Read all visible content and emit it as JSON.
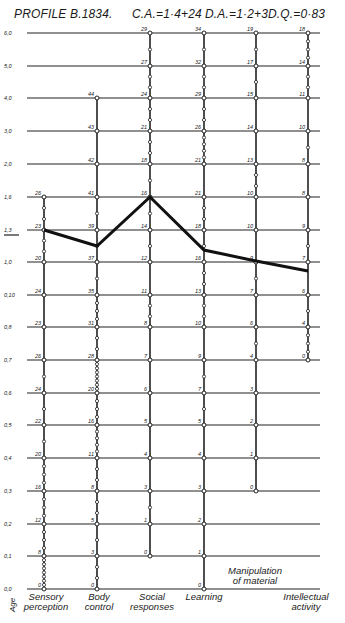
{
  "header": {
    "profile": "PROFILE B.1834.",
    "ca": "C.A.=1·4+24",
    "da": "D.A.=1·2+3",
    "dq": "D.Q.=0·83"
  },
  "chart_data": {
    "type": "line",
    "xlabel": "",
    "ylabel": "Age",
    "y_ticks": [
      "6,0",
      "5,0",
      "4,0",
      "3,0",
      "2,0",
      "1,6",
      "1,3",
      "1,0",
      "0,10",
      "0,8",
      "0,7",
      "0,6",
      "0,5",
      "0,4",
      "0,3",
      "0,2",
      "0,1",
      "0,0"
    ],
    "y_tick_px": [
      33,
      66,
      98,
      131,
      164,
      197,
      230,
      262,
      295,
      327,
      360,
      393,
      425,
      458,
      491,
      524,
      556,
      589
    ],
    "highlighted_tick": "1,3",
    "categories": [
      "Sensory perception",
      "Body control",
      "Social responses",
      "Learning",
      "Manipulation of material",
      "Intellectual activity"
    ],
    "column_x": [
      44,
      97,
      150,
      204,
      256,
      308
    ],
    "columns": [
      {
        "name": "Sensory perception",
        "label_lines": [
          "Sensory",
          "perception"
        ],
        "top_tick": "1,6",
        "scale": [
          {
            "y": "1,6",
            "v": "26"
          },
          {
            "y": "1,3",
            "v": "23"
          },
          {
            "y": "1,0",
            "v": "20"
          },
          {
            "y": "0,10",
            "v": "24"
          },
          {
            "y": "0,8",
            "v": "23"
          },
          {
            "y": "0,7",
            "v": "26"
          },
          {
            "y": "0,6",
            "v": "24"
          },
          {
            "y": "0,5",
            "v": "22"
          },
          {
            "y": "0,4",
            "v": "20"
          },
          {
            "y": "0,3",
            "v": "16"
          },
          {
            "y": "0,2",
            "v": "12"
          },
          {
            "y": "0,1",
            "v": "8"
          },
          {
            "y": "0,0",
            "v": "0"
          }
        ]
      },
      {
        "name": "Body control",
        "label_lines": [
          "Body",
          "control"
        ],
        "top_tick": "4,0",
        "scale": [
          {
            "y": "4,0",
            "v": "44"
          },
          {
            "y": "3,0",
            "v": "43"
          },
          {
            "y": "2,0",
            "v": "42"
          },
          {
            "y": "1,6",
            "v": "41"
          },
          {
            "y": "1,3",
            "v": "39"
          },
          {
            "y": "1,0",
            "v": "37"
          },
          {
            "y": "0,10",
            "v": "35"
          },
          {
            "y": "0,8",
            "v": "31"
          },
          {
            "y": "0,7",
            "v": "28"
          },
          {
            "y": "0,6",
            "v": "20"
          },
          {
            "y": "0,5",
            "v": "16"
          },
          {
            "y": "0,4",
            "v": "11"
          },
          {
            "y": "0,3",
            "v": "8"
          },
          {
            "y": "0,2",
            "v": "5"
          },
          {
            "y": "0,1",
            "v": "3"
          },
          {
            "y": "0,0",
            "v": "0"
          }
        ]
      },
      {
        "name": "Social responses",
        "label_lines": [
          "Social",
          "responses"
        ],
        "top_tick": "6,0",
        "scale": [
          {
            "y": "6,0",
            "v": "29"
          },
          {
            "y": "5,0",
            "v": "27"
          },
          {
            "y": "4,0",
            "v": "24"
          },
          {
            "y": "3,0",
            "v": "21"
          },
          {
            "y": "2,0",
            "v": "18"
          },
          {
            "y": "1,6",
            "v": "16"
          },
          {
            "y": "1,3",
            "v": "14"
          },
          {
            "y": "1,0",
            "v": "12"
          },
          {
            "y": "0,10",
            "v": "11"
          },
          {
            "y": "0,8",
            "v": "8"
          },
          {
            "y": "0,7",
            "v": "7"
          },
          {
            "y": "0,6",
            "v": "6"
          },
          {
            "y": "0,5",
            "v": "5"
          },
          {
            "y": "0,4",
            "v": "4"
          },
          {
            "y": "0,3",
            "v": "3"
          },
          {
            "y": "0,2",
            "v": "1"
          },
          {
            "y": "0,1",
            "v": "0"
          }
        ]
      },
      {
        "name": "Learning",
        "label_lines": [
          "Learning"
        ],
        "top_tick": "6,0",
        "scale": [
          {
            "y": "6,0",
            "v": "34"
          },
          {
            "y": "5,0",
            "v": "32"
          },
          {
            "y": "4,0",
            "v": "29"
          },
          {
            "y": "3,0",
            "v": "26"
          },
          {
            "y": "2,0",
            "v": "21"
          },
          {
            "y": "1,6",
            "v": "21"
          },
          {
            "y": "1,3",
            "v": "18"
          },
          {
            "y": "1,0",
            "v": "16"
          },
          {
            "y": "0,10",
            "v": "13"
          },
          {
            "y": "0,8",
            "v": "10"
          },
          {
            "y": "0,7",
            "v": "9"
          },
          {
            "y": "0,6",
            "v": "7"
          },
          {
            "y": "0,5",
            "v": "5"
          },
          {
            "y": "0,4",
            "v": "4"
          },
          {
            "y": "0,3",
            "v": "3"
          },
          {
            "y": "0,2",
            "v": "2"
          },
          {
            "y": "0,1",
            "v": "1"
          },
          {
            "y": "0,0",
            "v": "0"
          }
        ]
      },
      {
        "name": "Manipulation of material",
        "label_lines": [
          "Manipulation",
          "of material"
        ],
        "top_tick": "6,0",
        "scale": [
          {
            "y": "6,0",
            "v": "19"
          },
          {
            "y": "5,0",
            "v": "17"
          },
          {
            "y": "4,0",
            "v": "15"
          },
          {
            "y": "3,0",
            "v": "14"
          },
          {
            "y": "2,0",
            "v": "13"
          },
          {
            "y": "1,6",
            "v": "10"
          },
          {
            "y": "1,3",
            "v": "10"
          },
          {
            "y": "1,0",
            "v": "9"
          },
          {
            "y": "0,10",
            "v": "7"
          },
          {
            "y": "0,8",
            "v": "6"
          },
          {
            "y": "0,7",
            "v": "4"
          },
          {
            "y": "0,6",
            "v": "3"
          },
          {
            "y": "0,5",
            "v": "2"
          },
          {
            "y": "0,4",
            "v": "1"
          },
          {
            "y": "0,3",
            "v": "0"
          }
        ]
      },
      {
        "name": "Intellectual activity",
        "label_lines": [
          "Intellectual",
          "activity"
        ],
        "top_tick": "6,0",
        "scale": [
          {
            "y": "6,0",
            "v": "18"
          },
          {
            "y": "5,0",
            "v": "14"
          },
          {
            "y": "4,0",
            "v": "11"
          },
          {
            "y": "3,0",
            "v": "10"
          },
          {
            "y": "2,0",
            "v": "8"
          },
          {
            "y": "1,6",
            "v": "8"
          },
          {
            "y": "1,3",
            "v": "9"
          },
          {
            "y": "1,0",
            "v": "7"
          },
          {
            "y": "0,10",
            "v": "6"
          },
          {
            "y": "0,8",
            "v": "4"
          },
          {
            "y": "0,7",
            "v": "0"
          }
        ]
      }
    ],
    "series": [
      {
        "name": "Profile B.1834",
        "points_age": [
          {
            "category": "Sensory perception",
            "age": "1,3"
          },
          {
            "category": "Body control",
            "age": "≈1,2"
          },
          {
            "category": "Social responses",
            "age": "1,6"
          },
          {
            "category": "Learning",
            "age": "≈1,2"
          },
          {
            "category": "Manipulation of material",
            "age": "≈1,0+"
          },
          {
            "category": "Intellectual activity",
            "age": "≈1,0"
          }
        ],
        "points_px": [
          [
            44,
            230
          ],
          [
            97,
            246
          ],
          [
            150,
            197
          ],
          [
            204,
            250
          ],
          [
            256,
            261
          ],
          [
            308,
            271
          ]
        ]
      }
    ],
    "grid": true
  }
}
